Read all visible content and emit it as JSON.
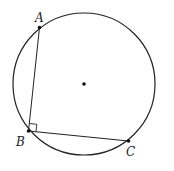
{
  "diagram": {
    "circle": {
      "cx": 84,
      "cy": 84,
      "r": 71,
      "stroke": "#222222"
    },
    "center_point": {
      "x": 84,
      "y": 84
    },
    "points": {
      "A": {
        "label": "A",
        "x": 39.5,
        "y": 27.5,
        "label_x": 35,
        "label_y": 22
      },
      "B": {
        "label": "B",
        "x": 28.5,
        "y": 131,
        "label_x": 16,
        "label_y": 146
      },
      "C": {
        "label": "C",
        "x": 128.5,
        "y": 141,
        "label_x": 126,
        "label_y": 156
      }
    },
    "right_angle_marker_at": "B"
  }
}
